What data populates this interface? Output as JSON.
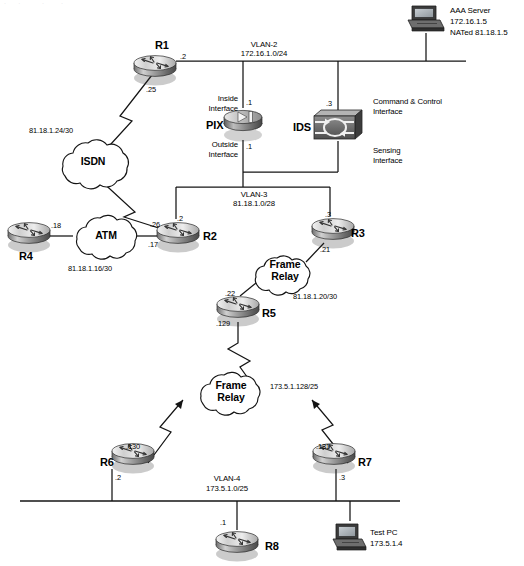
{
  "diagram": {
    "top_artifact": "·  ·    ·   ·",
    "colors": {
      "line": "#1a1a1a",
      "device_dark": "#4a4a4a",
      "device_mid": "#9a9a9a",
      "device_light": "#d8d8d8",
      "text": "#000000"
    }
  },
  "devices": {
    "r1": {
      "name": "R1",
      "icon": "router-icon"
    },
    "r2": {
      "name": "R2",
      "icon": "router-icon"
    },
    "r3": {
      "name": "R3",
      "icon": "router-icon"
    },
    "r4": {
      "name": "R4",
      "icon": "router-icon"
    },
    "r5": {
      "name": "R5",
      "icon": "router-icon"
    },
    "r6": {
      "name": "R6",
      "icon": "router-icon"
    },
    "r7": {
      "name": "R7",
      "icon": "router-icon"
    },
    "r8": {
      "name": "R8",
      "icon": "router-icon"
    },
    "pix": {
      "name": "PIX",
      "icon": "firewall-icon"
    },
    "ids": {
      "name": "IDS",
      "icon": "ids-sensor-icon"
    },
    "aaa": {
      "name": "AAA Server",
      "ip": "172.16.1.5",
      "nat": "NATed 81.18.1.5",
      "icon": "server-workstation-icon"
    },
    "testpc": {
      "name": "Test PC",
      "ip": "173.5.1.4",
      "icon": "pc-workstation-icon"
    }
  },
  "clouds": {
    "isdn": {
      "name": "ISDN",
      "network": "81.18.1.24/30"
    },
    "atm": {
      "name": "ATM",
      "network": "81.18.1.16/30"
    },
    "fr_upper": {
      "name_line1": "Frame",
      "name_line2": "Relay",
      "network": "81.18.1.20/30"
    },
    "fr_lower": {
      "name_line1": "Frame",
      "name_line2": "Relay",
      "network": "173.5.1.128/25"
    }
  },
  "segments": {
    "vlan2": {
      "name": "VLAN-2",
      "network": "172.16.1.0/24"
    },
    "vlan3": {
      "name": "VLAN-3",
      "network": "81.18.1.0/28"
    },
    "vlan4": {
      "name": "VLAN-4",
      "network": "173.5.1.0/25"
    }
  },
  "interfaces": {
    "pix_inside_label_l1": "Inside",
    "pix_inside_label_l2": "Interface",
    "pix_outside_label_l1": "Outside",
    "pix_outside_label_l2": "Interface",
    "ids_cc_label_l1": "Command & Control",
    "ids_cc_label_l2": "Interface",
    "ids_sensing_label_l1": "Sensing",
    "ids_sensing_label_l2": "Interface"
  },
  "octets": {
    "r1_vlan2": ".2",
    "r1_isdn": ".25",
    "pix_inside": ".1",
    "pix_outside": ".1",
    "ids_cc": ".3",
    "r2_vlan3": ".2",
    "r2_isdn": ".26",
    "r2_atm": ".17",
    "r4_atm": ".18",
    "r3_vlan3": ".3",
    "r3_fr": ".21",
    "r5_fr": ".22",
    "r5_down": ".129",
    "r6_fr": ".130",
    "r6_vlan4": ".2",
    "r7_fr": ".131",
    "r7_vlan4": ".3",
    "r8_vlan4": ".1"
  }
}
